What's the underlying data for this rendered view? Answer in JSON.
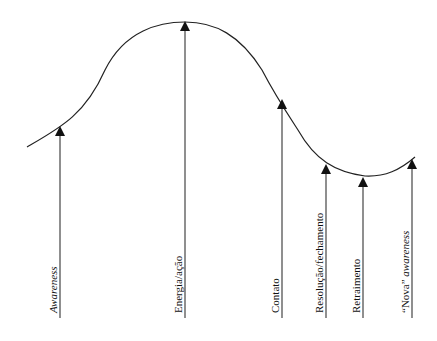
{
  "diagram": {
    "type": "cycle-of-experience curve",
    "stages": [
      {
        "label": "Awareness",
        "italic": true,
        "x": 60,
        "top": 127
      },
      {
        "label": "Energia/ação",
        "italic": false,
        "x": 185,
        "top": 22
      },
      {
        "label": "Contato",
        "italic": false,
        "x": 282,
        "top": 100
      },
      {
        "label": "Resolução/fechamento",
        "italic": false,
        "x": 326,
        "top": 165
      },
      {
        "label": "Retraimento",
        "italic": false,
        "x": 363,
        "top": 178
      },
      {
        "label_prefix": "“Nova”",
        "label_suffix": "awareness",
        "x": 412,
        "top": 160
      }
    ],
    "line_bottom": 318,
    "stroke_color": "#222222"
  }
}
